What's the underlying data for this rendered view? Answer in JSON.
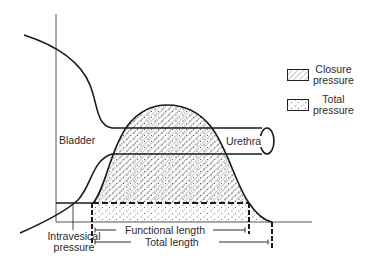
{
  "diagram": {
    "labels": {
      "bladder": "Bladder",
      "urethra": "Urethra",
      "intravesical_line1": "Intravesical",
      "intravesical_line2": "pressure",
      "functional_length": "Functional length",
      "total_length": "Total length"
    },
    "legend": [
      {
        "line1": "Closure",
        "line2": "pressure",
        "pattern": "diagonal-hatch"
      },
      {
        "line1": "Total",
        "line2": "pressure",
        "pattern": "stipple-dots"
      }
    ],
    "colors": {
      "line": "#1a1a1a",
      "axis": "#555555",
      "hatch": "#8a8a8a",
      "background": "#ffffff"
    }
  }
}
